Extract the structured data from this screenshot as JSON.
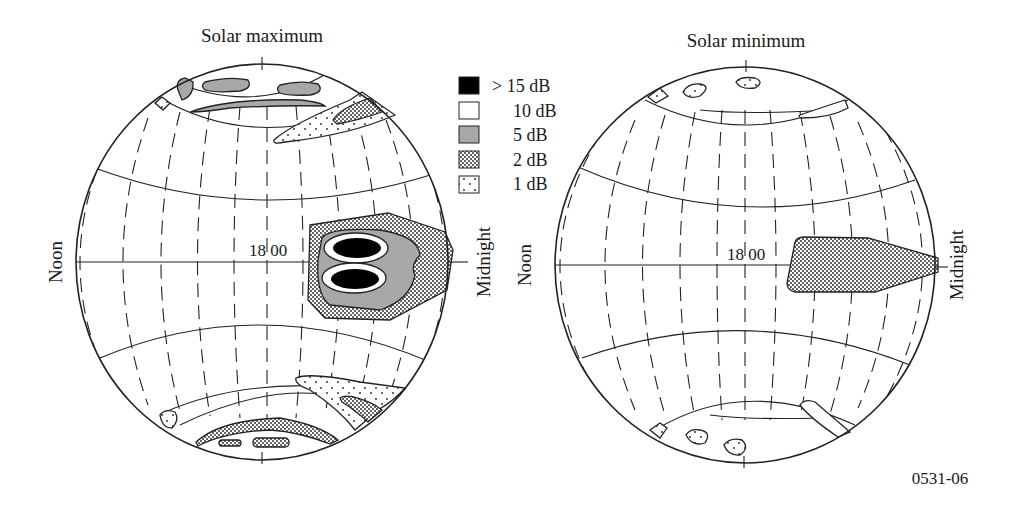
{
  "figure_id": "0531-06",
  "panels": [
    {
      "title": "Solar maximum",
      "left_label": "Noon",
      "right_label": "Midnight",
      "center_label": "18 00"
    },
    {
      "title": "Solar minimum",
      "left_label": "Noon",
      "right_label": "Midnight",
      "center_label": "18 00"
    }
  ],
  "legend": {
    "items": [
      {
        "label": "> 15 dB",
        "pattern": "solid-black",
        "color": "#000000"
      },
      {
        "label": "10 dB",
        "pattern": "white",
        "color": "#ffffff"
      },
      {
        "label": "5 dB",
        "pattern": "gray",
        "color": "#a8a8a8"
      },
      {
        "label": "2 dB",
        "pattern": "dense-dots",
        "color": "#555555"
      },
      {
        "label": "1 dB",
        "pattern": "sparse-dots",
        "color": "#ffffff"
      }
    ]
  },
  "colors": {
    "line": "#222222",
    "gray_fill": "#a8a8a8",
    "black_fill": "#000000",
    "background": "#ffffff"
  }
}
